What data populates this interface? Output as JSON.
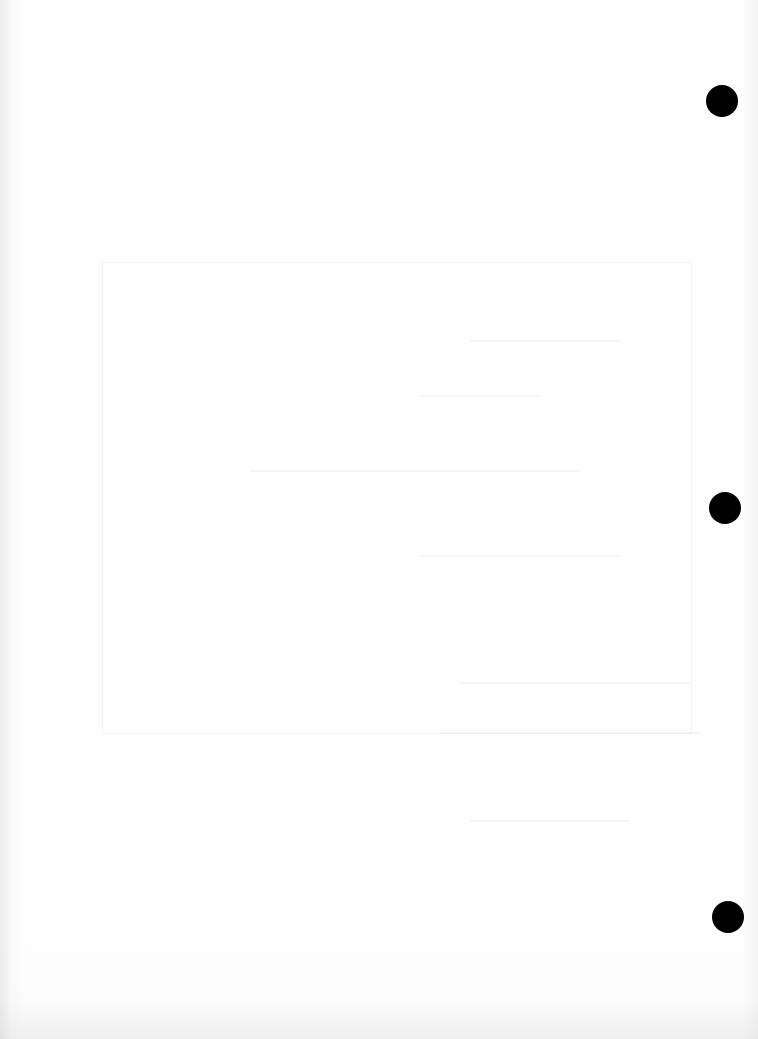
{
  "page": {
    "type": "blank scanned sheet",
    "background_color": "#fdfdfd",
    "content_text": ""
  },
  "punch_holes": [
    {
      "id": "top",
      "color": "#000000"
    },
    {
      "id": "middle",
      "color": "#000000"
    },
    {
      "id": "bottom",
      "color": "#000000"
    }
  ]
}
